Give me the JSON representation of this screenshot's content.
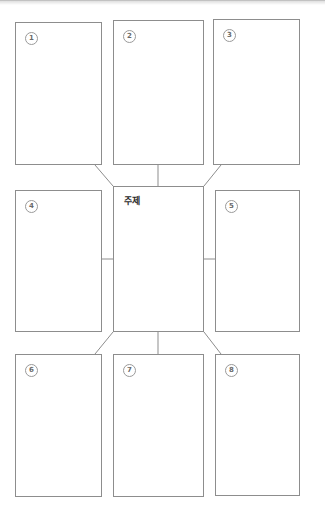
{
  "worksheet": {
    "kind": "mind-map-worksheet",
    "center": {
      "label": "주제",
      "name": "center-topic-box"
    },
    "cells": [
      {
        "badge": "1",
        "label": "",
        "position": "top-left"
      },
      {
        "badge": "2",
        "label": "",
        "position": "top-center"
      },
      {
        "badge": "3",
        "label": "",
        "position": "top-right"
      },
      {
        "badge": "4",
        "label": "",
        "position": "middle-left"
      },
      {
        "badge": "5",
        "label": "",
        "position": "middle-right"
      },
      {
        "badge": "6",
        "label": "",
        "position": "bottom-left"
      },
      {
        "badge": "7",
        "label": "",
        "position": "bottom-center"
      },
      {
        "badge": "8",
        "label": "",
        "position": "bottom-right"
      }
    ],
    "colors": {
      "border": "#8d8d8d",
      "connector": "#8d8d8d",
      "badge_border": "#9a9a9a",
      "badge_text": "#6a6a6a",
      "label_text": "#2b2b2b",
      "page_background": "#ffffff"
    }
  }
}
